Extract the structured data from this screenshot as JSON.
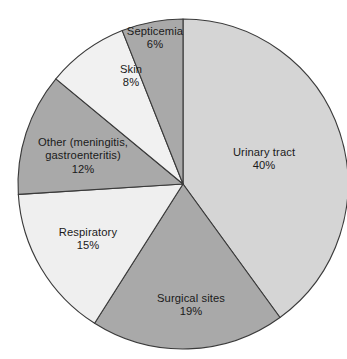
{
  "chart_data": {
    "type": "pie",
    "title": "",
    "subtitle": "",
    "xlabel": "",
    "ylabel": "",
    "grid": false,
    "legend_position": "none",
    "label_style": "inside-slice",
    "units": "percent",
    "start_angle_deg": 0,
    "direction": "clockwise",
    "categories": [
      "Urinary tract",
      "Surgical sites",
      "Respiratory",
      "Other (meningitis, gastroenteritis)",
      "Skin",
      "Septicemia"
    ],
    "values": [
      40,
      19,
      15,
      12,
      8,
      6
    ],
    "value_labels": [
      "40%",
      "19%",
      "15%",
      "12%",
      "8%",
      "6%"
    ],
    "colors": [
      "#d5d5d5",
      "#a9a9a9",
      "#efefef",
      "#a9a9a9",
      "#f1f1f1",
      "#a9a9a9"
    ],
    "slices": [
      {
        "name": "Urinary tract",
        "label_line1": "Urinary tract",
        "label_line2": "",
        "value": 40,
        "value_label": "40%",
        "color": "#d5d5d5"
      },
      {
        "name": "Surgical sites",
        "label_line1": "Surgical sites",
        "label_line2": "",
        "value": 19,
        "value_label": "19%",
        "color": "#a9a9a9"
      },
      {
        "name": "Respiratory",
        "label_line1": "Respiratory",
        "label_line2": "",
        "value": 15,
        "value_label": "15%",
        "color": "#efefef"
      },
      {
        "name": "Other (meningitis, gastroenteritis)",
        "label_line1": "Other (meningitis,",
        "label_line2": "gastroenteritis)",
        "value": 12,
        "value_label": "12%",
        "color": "#a9a9a9"
      },
      {
        "name": "Skin",
        "label_line1": "Skin",
        "label_line2": "",
        "value": 8,
        "value_label": "8%",
        "color": "#f1f1f1"
      },
      {
        "name": "Septicemia",
        "label_line1": "Septicemia",
        "label_line2": "",
        "value": 6,
        "value_label": "6%",
        "color": "#a9a9a9"
      }
    ],
    "geometry": {
      "center_x": 183,
      "center_y": 184,
      "radius": 165,
      "outline_color": "#3a3a3a",
      "background": "#ffffff"
    },
    "label_positions": [
      {
        "x": 264,
        "y": 146
      },
      {
        "x": 191,
        "y": 292
      },
      {
        "x": 88,
        "y": 226
      },
      {
        "x": 83,
        "y": 136
      },
      {
        "x": 131,
        "y": 63
      },
      {
        "x": 155,
        "y": 25
      }
    ]
  }
}
